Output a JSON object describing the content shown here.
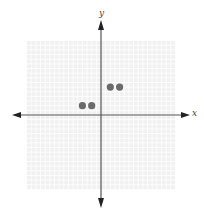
{
  "chart_data": {
    "type": "scatter",
    "title": "",
    "xlabel": "x",
    "ylabel": "y",
    "xlim": [
      -8,
      8
    ],
    "ylim": [
      -8,
      8
    ],
    "grid": true,
    "legend": null,
    "series": [
      {
        "name": "points",
        "x": [
          -2,
          -1,
          1,
          2
        ],
        "y": [
          1,
          1,
          3,
          3
        ]
      }
    ],
    "colors": {
      "grid_background": "#f1f1f1",
      "grid_line": "#ffffff",
      "axis": "#555555",
      "point": "#6b6b6b"
    }
  },
  "labels": {
    "x_axis": "x",
    "y_axis": "y"
  }
}
